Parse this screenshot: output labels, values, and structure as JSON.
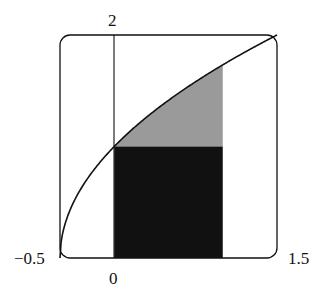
{
  "chart_data": {
    "type": "area",
    "title": "",
    "function": "y = sqrt(2x + 1)",
    "xlabel": "",
    "ylabel": "",
    "xlim": [
      -0.5,
      1.5
    ],
    "ylim": [
      0,
      2
    ],
    "tick_labels": {
      "x_left": "−0.5",
      "x_zero": "0",
      "x_right": "1.5",
      "y_top": "2"
    },
    "curve": {
      "x": [
        -0.5,
        -0.25,
        0,
        0.25,
        0.5,
        0.75,
        1.0,
        1.25,
        1.5
      ],
      "y": [
        0,
        0.707,
        1.0,
        1.225,
        1.414,
        1.581,
        1.732,
        1.871,
        2.0
      ]
    },
    "regions": [
      {
        "name": "rectangle",
        "x_from": 0,
        "x_to": 1,
        "y_from": 0,
        "y_to": 1,
        "color": "#111111"
      },
      {
        "name": "area-above-rectangle",
        "x_from": 0,
        "x_to": 1,
        "y_from": 1,
        "y_to": "sqrt(2x+1)",
        "color": "#9a9a9a"
      }
    ],
    "grid": false
  }
}
